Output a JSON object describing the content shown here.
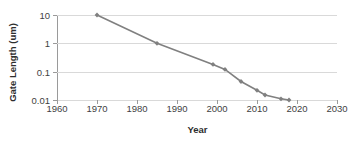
{
  "chart_data": {
    "type": "line",
    "title": "",
    "xlabel": "Year",
    "ylabel": "Gate Length (um)",
    "xlim": [
      1960,
      2030
    ],
    "ylim": [
      0.01,
      10
    ],
    "yscale": "log",
    "grid": true,
    "legend": "none",
    "series_color": "#808080",
    "marker": "diamond",
    "x_ticks": [
      "1960",
      "1970",
      "1980",
      "1990",
      "2000",
      "2010",
      "2020",
      "2030"
    ],
    "x_tick_values": [
      1960,
      1970,
      1980,
      1990,
      2000,
      2010,
      2020,
      2030
    ],
    "y_ticks": [
      "10",
      "1",
      "0.1",
      "0.01"
    ],
    "y_tick_values": [
      10,
      1,
      0.1,
      0.01
    ],
    "series": [
      {
        "name": "Gate Length",
        "points": [
          {
            "x": 1970,
            "y": 10
          },
          {
            "x": 1985,
            "y": 1
          },
          {
            "x": 1999,
            "y": 0.18
          },
          {
            "x": 2002,
            "y": 0.12
          },
          {
            "x": 2006,
            "y": 0.045
          },
          {
            "x": 2010,
            "y": 0.022
          },
          {
            "x": 2012,
            "y": 0.015
          },
          {
            "x": 2016,
            "y": 0.011
          },
          {
            "x": 2018,
            "y": 0.01
          }
        ]
      }
    ]
  }
}
